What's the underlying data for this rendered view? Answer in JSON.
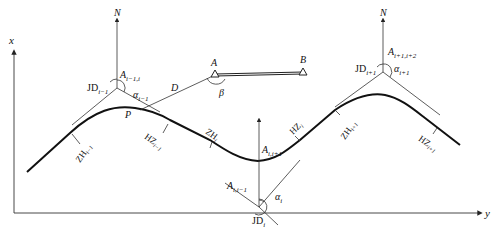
{
  "diagram": {
    "type": "route-curve-stakeout",
    "axes": {
      "x_label": "x",
      "y_label": "y"
    },
    "north_label": "N",
    "intersection_points": [
      {
        "id": "JD_i-1",
        "label": "JD",
        "sub": "i−1",
        "azimuth_label": "A",
        "azimuth_sub": "i−1,i",
        "angle_label": "α",
        "angle_sub": "i−1"
      },
      {
        "id": "JD_i",
        "label": "JD",
        "sub": "i",
        "azimuth_in_label": "A",
        "azimuth_in_sub": "i,i−1",
        "azimuth_out_label": "A",
        "azimuth_out_sub": "i,i+1",
        "angle_label": "α",
        "angle_sub": "i"
      },
      {
        "id": "JD_i+1",
        "label": "JD",
        "sub": "i+1",
        "azimuth_label": "A",
        "azimuth_sub": "i+1,i+2",
        "angle_label": "α",
        "angle_sub": "i+1"
      }
    ],
    "control_points": {
      "A": "A",
      "B": "B",
      "angle": "β",
      "distance": "D",
      "point": "P"
    },
    "curve_points": [
      {
        "label": "ZH",
        "sub": "i−1"
      },
      {
        "label": "HZ",
        "sub": "i−1"
      },
      {
        "label": "ZH",
        "sub": "i"
      },
      {
        "label": "HZ",
        "sub": "i"
      },
      {
        "label": "ZH",
        "sub": "i+1"
      },
      {
        "label": "HZ",
        "sub": "i+1"
      }
    ]
  }
}
